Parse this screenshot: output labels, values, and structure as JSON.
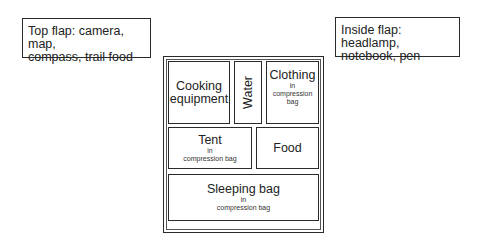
{
  "flaps": {
    "top": {
      "line1": "Top flap: camera, map,",
      "line2": "compass, trail food"
    },
    "inside": {
      "line1": "Inside flap: headlamp,",
      "line2": "notebook, pen"
    }
  },
  "pack": {
    "compartments": [
      {
        "id": "cooking",
        "line1": "Cooking",
        "line2": "equipment"
      },
      {
        "id": "water",
        "label": "Water"
      },
      {
        "id": "clothing",
        "label": "Clothing",
        "sub1": "in",
        "sub2": "compression",
        "sub3": "bag"
      },
      {
        "id": "tent",
        "label": "Tent",
        "sub1": "in",
        "sub2": "compression bag"
      },
      {
        "id": "food",
        "label": "Food"
      },
      {
        "id": "sleeping-bag",
        "label": "Sleeping bag",
        "sub1": "in",
        "sub2": "compression bag"
      }
    ]
  }
}
